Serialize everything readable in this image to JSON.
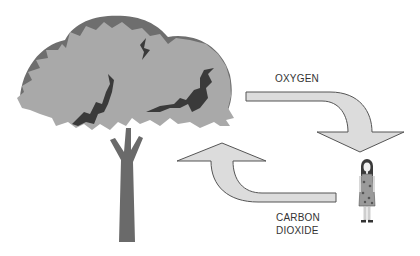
{
  "diagram": {
    "labels": {
      "oxygen": "OXYGEN",
      "carbon_dioxide_line1": "CARBON",
      "carbon_dioxide_line2": "DIOXIDE"
    },
    "elements": {
      "tree": "tree",
      "person": "woman",
      "arrow_oxygen": "arrow from tree to person",
      "arrow_co2": "arrow from person to tree"
    },
    "colors": {
      "canopy": "#a9a9a9",
      "canopy_shadow": "#6e6e6e",
      "branch_marks": "#3a3a3a",
      "trunk": "#6a6a6a",
      "arrow_fill": "#dcdcdc",
      "arrow_stroke": "#555555",
      "text": "#333333"
    }
  }
}
